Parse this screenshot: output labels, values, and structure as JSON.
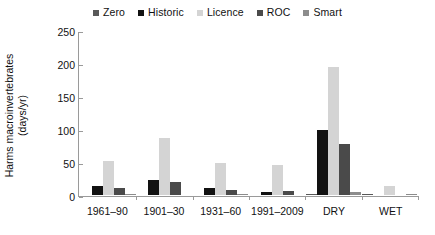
{
  "chart_data": {
    "type": "bar",
    "title": "",
    "subtitle": "",
    "xlabel": "",
    "ylabel": "Harms macroinvertebrates (days/yr)",
    "ylabel_line1": "Harms macroinvertebrates",
    "ylabel_line2": "(days/yr)",
    "categories": [
      "1961–90",
      "1901–30",
      "1931–60",
      "1991–2009",
      "DRY",
      "WET"
    ],
    "series": [
      {
        "name": "Zero",
        "color": "#595959",
        "values": [
          0,
          0,
          0,
          0,
          2,
          2
        ]
      },
      {
        "name": "Historic",
        "color": "#121212",
        "values": [
          13,
          23,
          11,
          5,
          98,
          0
        ]
      },
      {
        "name": "Licence",
        "color": "#d4d4d4",
        "values": [
          52,
          87,
          48,
          46,
          194,
          13
        ]
      },
      {
        "name": "ROC",
        "color": "#4a4a4a",
        "values": [
          11,
          19,
          8,
          6,
          78,
          0
        ]
      },
      {
        "name": "Smart",
        "color": "#8c8c8c",
        "values": [
          1,
          0,
          1,
          0,
          4,
          2
        ]
      }
    ],
    "ylim": [
      0,
      250
    ],
    "yticks": [
      0,
      50,
      100,
      150,
      200,
      250
    ],
    "ytick_labels": [
      "0",
      "50",
      "100",
      "150",
      "200",
      "250"
    ],
    "grid": false,
    "legend_position": "top-center"
  }
}
